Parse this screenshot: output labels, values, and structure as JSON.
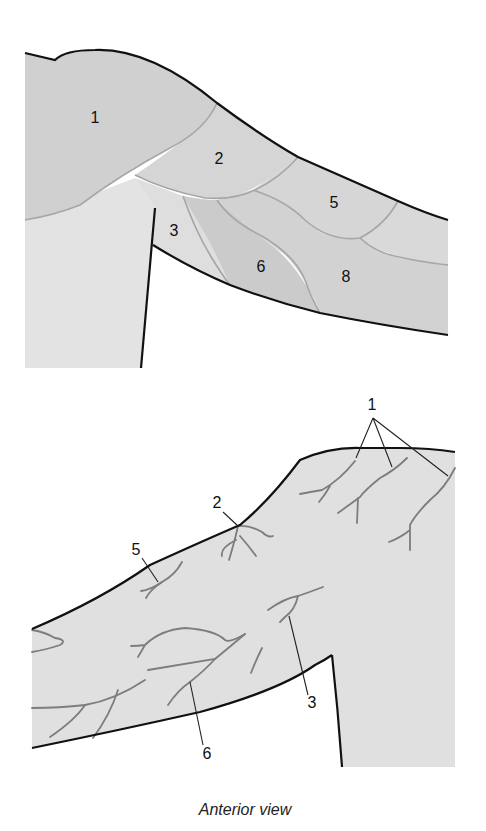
{
  "colors": {
    "background": "#ffffff",
    "skin_light": "#e3e3e3",
    "region_mid": "#d4d4d4",
    "region_dark": "#cbcbcb",
    "boundary": "#a6a6a6",
    "outline": "#111111",
    "nerve": "#7d7d7d",
    "leader": "#222222"
  },
  "top_panel": {
    "name": "dermatome-regions",
    "labels": [
      {
        "id": "1",
        "text": "1",
        "x": 95,
        "y": 123
      },
      {
        "id": "2",
        "text": "2",
        "x": 219,
        "y": 164
      },
      {
        "id": "3",
        "text": "3",
        "x": 174,
        "y": 236
      },
      {
        "id": "5",
        "text": "5",
        "x": 334,
        "y": 208
      },
      {
        "id": "6",
        "text": "6",
        "x": 261,
        "y": 272
      },
      {
        "id": "8",
        "text": "8",
        "x": 346,
        "y": 282
      }
    ]
  },
  "bottom_panel": {
    "name": "cutaneous-nerves",
    "labels": [
      {
        "id": "1",
        "text": "1",
        "x": 372,
        "y": 410
      },
      {
        "id": "2",
        "text": "2",
        "x": 217,
        "y": 508
      },
      {
        "id": "3",
        "text": "3",
        "x": 312,
        "y": 708
      },
      {
        "id": "5",
        "text": "5",
        "x": 136,
        "y": 555
      },
      {
        "id": "6",
        "text": "6",
        "x": 207,
        "y": 759
      }
    ],
    "caption": "Anterior view"
  }
}
